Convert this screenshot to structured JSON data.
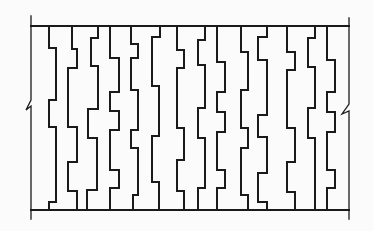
{
  "diagram": {
    "stroke_color": "#1a1a1a",
    "background": "#fbfbfb",
    "top_line": {
      "x1": 31,
      "x2": 349,
      "y": 26
    },
    "bottom_line": {
      "x1": 31,
      "x2": 349,
      "y": 210
    },
    "left_border": {
      "points": "31,16 31,100 26,110 31,106 31,219"
    },
    "right_border": {
      "points": "349,18 349,104 342,114 349,111 349,219"
    },
    "stepped_lines": [
      {
        "id": "line-1",
        "points": "49,26 49,48 56,48 56,100 49,100 49,127 56,127 56,202 49,202 49,210"
      },
      {
        "id": "line-2",
        "points": "72,26 72,49 77,49 77,68 68,68 68,127 77,127 77,162 68,162 68,191 77,191 77,210"
      },
      {
        "id": "line-3",
        "points": "98,26 98,38 91,38 91,66 98,66 98,109 88,109 88,138 97,138 97,190 87,190 87,210"
      },
      {
        "id": "line-4",
        "points": "110,26 110,58 119,58 119,92 110,92 110,111 119,111 119,130 110,130 110,170 119,170 119,188 110,188 110,210"
      },
      {
        "id": "line-5",
        "points": "131,26 131,44 138,44 138,58 131,58 131,90 138,90 138,130 131,130 131,148 138,148 138,195 133,195 133,210"
      },
      {
        "id": "line-6",
        "points": "160,26 160,37 152,37 152,86 159,86 159,136 152,136 152,182 159,182 159,210"
      },
      {
        "id": "line-7",
        "points": "177,26 177,50 184,50 184,68 177,68 177,128 184,128 184,160 177,160 177,191 184,191 184,210"
      },
      {
        "id": "line-8",
        "points": "205,26 205,40 198,40 198,65 205,65 205,108 198,108 198,138 205,138 205,188 198,188 198,210"
      },
      {
        "id": "line-9",
        "points": "217,26 217,62 225,62 225,92 217,92 217,112 225,112 225,132 217,132 217,170 225,170 225,188 217,188 217,210"
      },
      {
        "id": "line-10",
        "points": "267,26 267,37 258,37 258,60 267,60 267,115 258,115 258,137 267,137 267,173 258,173 258,202 267,202 267,210"
      },
      {
        "id": "line-11",
        "points": "287,26 287,52 295,52 295,70 287,70 287,128 295,128 295,162 287,162 287,192 295,192 295,210"
      },
      {
        "id": "line-12",
        "points": "315,26 315,38 308,38 308,67 315,67 315,108 308,108 308,138 315,138 315,210"
      },
      {
        "id": "line-13",
        "points": "327,26 327,60 335,60 335,92 327,92 327,112 335,112 335,132 327,132 327,170 335,170 335,188 327,188 327,210"
      },
      {
        "id": "line-14",
        "points": "241,26 241,52 248,52 248,90 241,90 241,128 248,128 248,148 241,148 241,195 248,195 248,210"
      }
    ]
  }
}
